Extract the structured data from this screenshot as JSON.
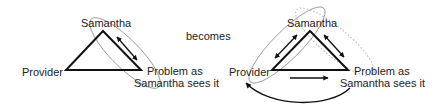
{
  "left_diagram": {
    "top_label": "Samantha",
    "left_label": "Provider",
    "right_label_line1": "Problem as",
    "right_label_line2": "Samantha sees it"
  },
  "connector": {
    "label": "becomes"
  },
  "right_diagram": {
    "top_label": "Samantha",
    "left_label": "Provider",
    "right_label_line1": "Problem as",
    "right_label_line2": "Samantha sees it"
  },
  "colors": {
    "line": "#111111",
    "ellipse": "#8a8a8a",
    "dotted": "#b5b5b5",
    "text": "#222222"
  }
}
